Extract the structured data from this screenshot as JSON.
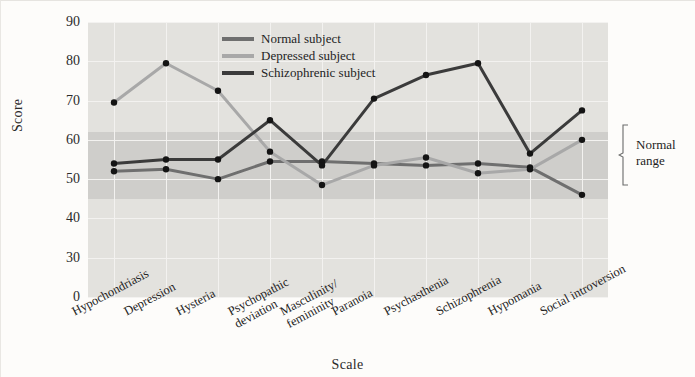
{
  "chart_data": {
    "type": "line",
    "title": "",
    "xlabel": "Scale",
    "ylabel": "Score",
    "ylim": [
      0,
      90
    ],
    "yticks": [
      0,
      30,
      40,
      50,
      60,
      70,
      80,
      90
    ],
    "grid": true,
    "legend_position": "top-center",
    "categories": [
      "Hypochondriasis",
      "Depression",
      "Hysteria",
      "Psychopathic deviation",
      "Masculinity/femininity",
      "Paranoia",
      "Psychasthenia",
      "Schizophrenia",
      "Hypomania",
      "Social introversion"
    ],
    "category_lines": [
      [
        "Hypochondriasis"
      ],
      [
        "Depression"
      ],
      [
        "Hysteria"
      ],
      [
        "Psychopathic",
        "deviation"
      ],
      [
        "Masculinity/",
        "femininity"
      ],
      [
        "Paranoia"
      ],
      [
        "Psychasthenia"
      ],
      [
        "Schizophrenia"
      ],
      [
        "Hypomania"
      ],
      [
        "Social introversion"
      ]
    ],
    "series": [
      {
        "name": "Normal subject",
        "color": "#6f6f6f",
        "values": [
          52,
          52.5,
          50,
          54.5,
          54.5,
          54,
          53.5,
          54,
          53,
          46
        ]
      },
      {
        "name": "Depressed subject",
        "color": "#a8a8a8",
        "values": [
          69.5,
          79.5,
          72.5,
          57,
          48.5,
          53.5,
          55.5,
          51.5,
          52.5,
          60
        ]
      },
      {
        "name": "Schizophrenic subject",
        "color": "#3b3b3b",
        "values": [
          54,
          55,
          55,
          65,
          53.5,
          70.5,
          76.5,
          79.5,
          56.5,
          67.5
        ]
      }
    ],
    "annotations": [
      {
        "name": "normal-range",
        "label_lines": [
          "Normal",
          "range"
        ],
        "y_from": 45,
        "y_to": 62
      }
    ],
    "shaded_band": {
      "label": "Normal range",
      "y_from": 45,
      "y_to": 62,
      "color": "#cfcecb"
    },
    "plot_background": "#e3e2de"
  }
}
